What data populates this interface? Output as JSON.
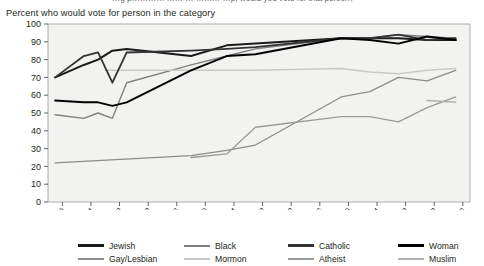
{
  "header": {
    "cut_off_line": "…g p………… …… … ……… …p, would you vote for that person?",
    "subtitle": "Percent who would vote for person in the category"
  },
  "chart_data": {
    "type": "line",
    "title": "",
    "xlabel": "",
    "ylabel": "",
    "ylim": [
      0,
      100
    ],
    "ytick_values": [
      0,
      10,
      20,
      30,
      40,
      50,
      60,
      70,
      80,
      90,
      100
    ],
    "xtick_labels": [
      "1960",
      "1964",
      "1968",
      "1972",
      "1976",
      "1980",
      "1984",
      "1988",
      "1992",
      "1996",
      "2000",
      "2004",
      "2008",
      "2012",
      "2016"
    ],
    "xlim": [
      1958,
      2017
    ],
    "grid": false,
    "legend_position": "bottom",
    "plot_bg": "#f2f2f0",
    "series": [
      {
        "name": "Jewish",
        "color": "#1a1a1a",
        "width": 2.0,
        "points": [
          [
            1959,
            70
          ],
          [
            1963,
            77
          ],
          [
            1965,
            80
          ],
          [
            1967,
            85
          ],
          [
            1969,
            86
          ],
          [
            1978,
            82
          ],
          [
            1983,
            88
          ],
          [
            1987,
            89
          ],
          [
            1999,
            92
          ],
          [
            2003,
            92
          ],
          [
            2007,
            92
          ],
          [
            2011,
            91
          ],
          [
            2015,
            91
          ]
        ]
      },
      {
        "name": "Gay/Lesbian",
        "color": "#8c8c8c",
        "width": 1.3,
        "points": [
          [
            1959,
            22
          ],
          [
            1978,
            26
          ],
          [
            1983,
            29
          ],
          [
            1987,
            32
          ],
          [
            1999,
            59
          ],
          [
            2003,
            62
          ],
          [
            2007,
            70
          ],
          [
            2011,
            68
          ],
          [
            2015,
            74
          ]
        ]
      },
      {
        "name": "Black",
        "color": "#808080",
        "width": 1.4,
        "points": [
          [
            1959,
            49
          ],
          [
            1963,
            47
          ],
          [
            1965,
            50
          ],
          [
            1967,
            47
          ],
          [
            1969,
            67
          ],
          [
            1978,
            77
          ],
          [
            1983,
            82
          ],
          [
            1987,
            86
          ],
          [
            1999,
            92
          ],
          [
            2003,
            92
          ],
          [
            2007,
            94
          ],
          [
            2011,
            93
          ],
          [
            2015,
            92
          ]
        ]
      },
      {
        "name": "Mormon",
        "color": "#c8c8c6",
        "width": 1.5,
        "points": [
          [
            1966,
            74
          ],
          [
            1978,
            74
          ],
          [
            1987,
            74
          ],
          [
            1999,
            75
          ],
          [
            2003,
            73
          ],
          [
            2007,
            72
          ],
          [
            2011,
            74
          ],
          [
            2015,
            75
          ]
        ]
      },
      {
        "name": "Catholic",
        "color": "#333333",
        "width": 1.8,
        "points": [
          [
            1959,
            70
          ],
          [
            1963,
            82
          ],
          [
            1965,
            84
          ],
          [
            1967,
            67
          ],
          [
            1969,
            84
          ],
          [
            1978,
            85
          ],
          [
            1983,
            86
          ],
          [
            1987,
            87
          ],
          [
            1999,
            92
          ],
          [
            2003,
            92
          ],
          [
            2007,
            94
          ],
          [
            2011,
            91
          ],
          [
            2015,
            92
          ]
        ]
      },
      {
        "name": "Atheist",
        "color": "#9a9a9a",
        "width": 1.3,
        "points": [
          [
            1978,
            25
          ],
          [
            1983,
            27
          ],
          [
            1987,
            42
          ],
          [
            1999,
            48
          ],
          [
            2003,
            48
          ],
          [
            2007,
            45
          ],
          [
            2011,
            53
          ],
          [
            2015,
            59
          ]
        ]
      },
      {
        "name": "Woman",
        "color": "#000000",
        "width": 1.9,
        "points": [
          [
            1959,
            57
          ],
          [
            1963,
            56
          ],
          [
            1965,
            56
          ],
          [
            1967,
            54
          ],
          [
            1969,
            56
          ],
          [
            1978,
            74
          ],
          [
            1983,
            82
          ],
          [
            1987,
            83
          ],
          [
            1999,
            92
          ],
          [
            2003,
            91
          ],
          [
            2007,
            89
          ],
          [
            2011,
            93
          ],
          [
            2015,
            91
          ]
        ]
      },
      {
        "name": "Muslim",
        "color": "#b0b0b0",
        "width": 1.4,
        "points": [
          [
            2011,
            57
          ],
          [
            2015,
            56
          ]
        ]
      }
    ]
  },
  "legend": {
    "items": [
      {
        "label": "Jewish",
        "color": "#1a1a1a",
        "height": 3
      },
      {
        "label": "Black",
        "color": "#808080",
        "height": 2
      },
      {
        "label": "Catholic",
        "color": "#333333",
        "height": 3
      },
      {
        "label": "Woman",
        "color": "#000000",
        "height": 3
      },
      {
        "label": "Gay/Lesbian",
        "color": "#8c8c8c",
        "height": 2
      },
      {
        "label": "Mormon",
        "color": "#c8c8c6",
        "height": 2
      },
      {
        "label": "Atheist",
        "color": "#9a9a9a",
        "height": 2
      },
      {
        "label": "Muslim",
        "color": "#b0b0b0",
        "height": 2
      }
    ]
  }
}
